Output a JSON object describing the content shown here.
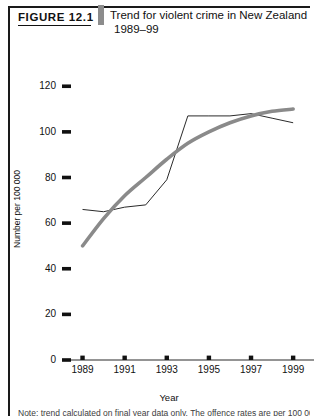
{
  "figure": {
    "label": "FIGURE 12.1",
    "title_line1": "Trend for violent crime in New Zealand",
    "title_line2": "1989–99"
  },
  "footer": {
    "clipped_caption": "Note: trend calculated on final year data only. The offence rates are per 100 000 population."
  },
  "chart_data": {
    "type": "line",
    "title": "Trend for violent crime in New Zealand 1989–99",
    "xlabel": "Year",
    "ylabel": "Number per 100 000",
    "xlim": [
      1988.5,
      1999.8
    ],
    "ylim": [
      0,
      128
    ],
    "grid": false,
    "legend": "none",
    "yticks": [
      0,
      20,
      40,
      60,
      80,
      100,
      120
    ],
    "ytick_labels": [
      "0",
      "20",
      "40",
      "60",
      "80",
      "100",
      "120"
    ],
    "xticks": [
      1989,
      1991,
      1993,
      1995,
      1997,
      1999
    ],
    "xtick_labels": [
      "1989",
      "1991",
      "1993",
      "1995",
      "1997",
      "1999"
    ],
    "x": [
      1989,
      1990,
      1991,
      1992,
      1993,
      1994,
      1995,
      1996,
      1997,
      1998,
      1999
    ],
    "series": [
      {
        "name": "Violent crime rate",
        "style": "thin-black-line",
        "color": "#2a2a2a",
        "values": [
          66,
          65,
          67,
          68,
          79,
          107,
          107,
          107,
          108,
          106,
          104
        ]
      },
      {
        "name": "Trend line",
        "style": "thick-grey-smooth-curve",
        "color": "#8a8a8a",
        "values": [
          50,
          62,
          72,
          80,
          88,
          95,
          100,
          104,
          107,
          109,
          110
        ]
      }
    ]
  }
}
